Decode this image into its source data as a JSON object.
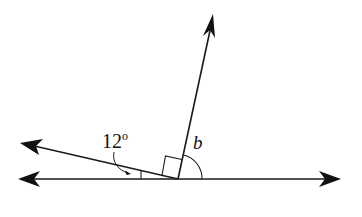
{
  "diagram": {
    "type": "angle-diagram",
    "labels": {
      "known_angle": "12",
      "degree_symbol": "o",
      "unknown_angle": "b"
    },
    "elements": [
      {
        "name": "horizontal-line",
        "description": "straight line with arrows at both ends"
      },
      {
        "name": "upward-ray",
        "description": "ray from vertex going up and slightly right"
      },
      {
        "name": "left-ray",
        "description": "ray from vertex going left and slightly up"
      },
      {
        "name": "right-angle-marker",
        "description": "square between left ray and upward ray"
      },
      {
        "name": "angle-12-marker",
        "description": "small angle between left ray and horizontal line, 12 degrees"
      },
      {
        "name": "angle-b-arc",
        "description": "arc between upward ray and right side of horizontal line"
      }
    ],
    "colors": {
      "stroke": "#1a1a1a",
      "background": "#ffffff"
    }
  }
}
